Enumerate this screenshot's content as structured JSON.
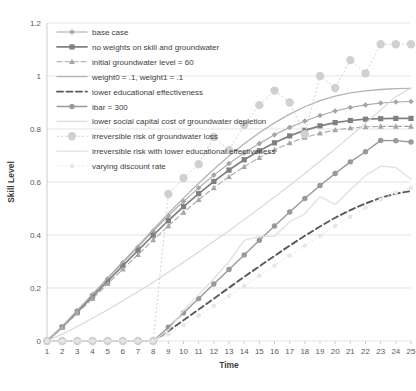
{
  "chart_data": {
    "type": "line",
    "title": "",
    "xlabel": "Time",
    "ylabel": "Skill Level",
    "xlim": [
      1,
      25
    ],
    "ylim": [
      0,
      1.2
    ],
    "grid": true,
    "legend_position": "upper-left-inside",
    "x": [
      1,
      2,
      3,
      4,
      5,
      6,
      7,
      8,
      9,
      10,
      11,
      12,
      13,
      14,
      15,
      16,
      17,
      18,
      19,
      20,
      21,
      22,
      23,
      24,
      25
    ],
    "xticks": [
      "1",
      "2",
      "3",
      "4",
      "5",
      "6",
      "7",
      "8",
      "9",
      "10",
      "11",
      "12",
      "13",
      "14",
      "15",
      "16",
      "17",
      "18",
      "19",
      "20",
      "21",
      "22",
      "23",
      "24",
      "25"
    ],
    "yticks": [
      "0",
      "0.2",
      "0.4",
      "0.6",
      "0.8",
      "1",
      "1.2"
    ],
    "series": [
      {
        "name": "base case",
        "color": "#a6a6a6",
        "style": "solid",
        "marker": "diamond",
        "width": 1.1,
        "values": [
          0.0,
          0.055,
          0.115,
          0.175,
          0.235,
          0.295,
          0.355,
          0.415,
          0.472,
          0.527,
          0.578,
          0.626,
          0.67,
          0.71,
          0.745,
          0.778,
          0.806,
          0.83,
          0.851,
          0.868,
          0.881,
          0.891,
          0.898,
          0.902,
          0.904
        ]
      },
      {
        "name": "no weights on skill and groundwater",
        "color": "#808080",
        "style": "solid",
        "marker": "square",
        "width": 1.7,
        "values": [
          0.0,
          0.052,
          0.11,
          0.168,
          0.226,
          0.284,
          0.342,
          0.399,
          0.454,
          0.507,
          0.556,
          0.602,
          0.645,
          0.684,
          0.718,
          0.748,
          0.774,
          0.795,
          0.812,
          0.824,
          0.832,
          0.837,
          0.839,
          0.84,
          0.84
        ]
      },
      {
        "name": "initial groundwater level = 60",
        "color": "#a6a6a6",
        "style": "dashed",
        "marker": "triangle",
        "width": 1.1,
        "values": [
          0.0,
          0.05,
          0.105,
          0.16,
          0.216,
          0.271,
          0.326,
          0.381,
          0.434,
          0.485,
          0.533,
          0.578,
          0.62,
          0.658,
          0.692,
          0.722,
          0.747,
          0.768,
          0.784,
          0.796,
          0.804,
          0.808,
          0.81,
          0.81,
          0.81
        ]
      },
      {
        "name": "weight0 = .1, weight1 = .1",
        "color": "#b3b3b3",
        "style": "solid",
        "marker": "none",
        "width": 1.3,
        "values": [
          0.0,
          0.055,
          0.116,
          0.177,
          0.238,
          0.299,
          0.36,
          0.421,
          0.481,
          0.539,
          0.595,
          0.648,
          0.698,
          0.744,
          0.786,
          0.823,
          0.856,
          0.884,
          0.907,
          0.924,
          0.936,
          0.944,
          0.949,
          0.952,
          0.953
        ]
      },
      {
        "name": "lower educational effectiveness",
        "color": "#595959",
        "style": "heavy-dashed",
        "marker": "none",
        "width": 1.9,
        "values": [
          0.0,
          0.0,
          0.0,
          0.0,
          0.0,
          0.0,
          0.0,
          0.0,
          0.038,
          0.078,
          0.119,
          0.16,
          0.201,
          0.242,
          0.282,
          0.321,
          0.36,
          0.397,
          0.432,
          0.465,
          0.494,
          0.519,
          0.54,
          0.556,
          0.566
        ]
      },
      {
        "name": "ibar = 300",
        "color": "#999999",
        "style": "solid",
        "marker": "circle",
        "width": 1.4,
        "values": [
          0.0,
          0.0,
          0.0,
          0.0,
          0.0,
          0.0,
          0.0,
          0.0,
          0.052,
          0.106,
          0.16,
          0.215,
          0.27,
          0.325,
          0.38,
          0.434,
          0.487,
          0.538,
          0.587,
          0.632,
          0.676,
          0.714,
          0.757,
          0.756,
          0.751
        ]
      },
      {
        "name": "lower social capital cost of groundwater depletion",
        "color": "#d9d9d9",
        "style": "solid",
        "marker": "none",
        "width": 1.2,
        "values": [
          0.0,
          0.026,
          0.055,
          0.086,
          0.118,
          0.152,
          0.186,
          0.222,
          0.259,
          0.297,
          0.336,
          0.376,
          0.416,
          0.458,
          0.5,
          0.543,
          0.587,
          0.632,
          0.678,
          0.725,
          0.773,
          0.822,
          0.872,
          0.922,
          0.955
        ]
      },
      {
        "name": "irreversible risk of groundwater loss",
        "color": "#d0d0d0",
        "style": "dotted",
        "marker": "circle-large",
        "width": 1.0,
        "values": [
          0.0,
          0.0,
          0.0,
          0.0,
          0.0,
          0.0,
          0.0,
          0.0,
          0.555,
          0.615,
          0.667,
          0.77,
          0.72,
          0.815,
          0.89,
          0.945,
          0.9,
          0.78,
          1.0,
          0.955,
          1.06,
          1.01,
          1.12,
          1.12,
          1.12
        ]
      },
      {
        "name": "irreversible risk with lower educational effectiveness",
        "color": "#e0e0e0",
        "style": "solid",
        "marker": "none",
        "width": 1.3,
        "values": [
          0.0,
          0.0,
          0.0,
          0.0,
          0.0,
          0.0,
          0.0,
          0.0,
          0.04,
          0.115,
          0.175,
          0.235,
          0.3,
          0.38,
          0.395,
          0.395,
          0.45,
          0.48,
          0.545,
          0.515,
          0.57,
          0.625,
          0.66,
          0.655,
          0.61
        ]
      },
      {
        "name": "varying discount rate",
        "color": "#e6e6e6",
        "style": "dotted",
        "marker": "circle-small",
        "width": 1.0,
        "values": [
          0.0,
          0.0,
          0.0,
          0.0,
          0.0,
          0.0,
          0.0,
          0.0,
          0.025,
          0.06,
          0.096,
          0.133,
          0.17,
          0.208,
          0.246,
          0.284,
          0.322,
          0.36,
          0.397,
          0.434,
          0.469,
          0.503,
          0.534,
          0.56,
          0.578
        ]
      }
    ]
  },
  "legend": {
    "items": [
      {
        "label": "base case"
      },
      {
        "label": "no weights on skill and groundwater"
      },
      {
        "label": "initial groundwater level = 60"
      },
      {
        "label": "weight0 = .1, weight1 = .1"
      },
      {
        "label": "lower educational effectiveness"
      },
      {
        "label": "ibar = 300"
      },
      {
        "label": "lower social capital cost of groundwater depletion"
      },
      {
        "label": "irreversible risk of groundwater loss"
      },
      {
        "label": "irreversible risk with lower educational effectiveness"
      },
      {
        "label": "varying discount rate"
      }
    ]
  },
  "axes": {
    "x_title": "Time",
    "y_title": "Skill Level"
  }
}
